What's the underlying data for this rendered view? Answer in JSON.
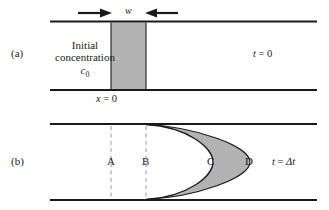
{
  "figure": {
    "type": "scientific-diagram",
    "colors": {
      "wall": "#1a1a1a",
      "shading": "#b3b3b3",
      "shading_edge": "#1a1a1a",
      "dashed_guide": "#9a9a9a",
      "background": "#ffffff",
      "text": "#1a1a1a"
    }
  },
  "panel_a": {
    "tag": "(a)",
    "width_label": "w",
    "body_line1": "Initial",
    "body_line2": "concentration",
    "body_symbol": "c",
    "body_subscript": "0",
    "time_symbol": "t",
    "time_equals": "=",
    "time_value": "0",
    "axis_symbol": "x",
    "axis_equals": "=",
    "axis_value": "0",
    "left_arrow_icon": "arrow-right-icon",
    "right_arrow_icon": "arrow-left-icon"
  },
  "panel_b": {
    "tag": "(b)",
    "stations": [
      {
        "label": "A",
        "x": 111,
        "has_dashed_guide": true
      },
      {
        "label": "B",
        "x": 146,
        "has_dashed_guide": true
      },
      {
        "label": "C",
        "x": 213,
        "has_dashed_guide": false
      },
      {
        "label": "D",
        "x": 250,
        "has_dashed_guide": false
      }
    ],
    "time_symbol": "t",
    "time_equals": "=",
    "time_value": "Δt"
  },
  "geometry": {
    "pipe_left": 50,
    "pipe_right": 317,
    "panel_a_top_wall_y": 21,
    "panel_a_bottom_wall_y": 90,
    "panel_b_top_wall_y": 124,
    "panel_b_bottom_wall_y": 200,
    "slug_left_x": 111,
    "slug_right_x": 146,
    "inner_parabola_vertex_x": 213,
    "outer_parabola_vertex_x": 250
  }
}
